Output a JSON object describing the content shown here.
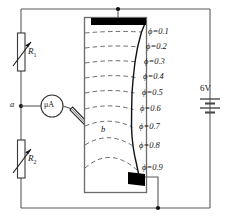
{
  "figure": {
    "colors": {
      "wire": "#5a5a5a",
      "tank": "#6b6b6b",
      "electrode": "#000000",
      "equipotential": "#6b6b6b",
      "fieldline": "#111111",
      "text": "#141414"
    }
  },
  "equipotentials": {
    "symbol": "ϕ",
    "labels": [
      {
        "name": "phi-0-1",
        "symbol": "ϕ",
        "eq": "=",
        "value": "0.1",
        "text": "ϕ=0.1"
      },
      {
        "name": "phi-0-2",
        "symbol": "ϕ",
        "eq": "=",
        "value": "0.2",
        "text": "ϕ=0.2"
      },
      {
        "name": "phi-0-3",
        "symbol": "ϕ",
        "eq": "=",
        "value": "0.3",
        "text": "ϕ=0.3"
      },
      {
        "name": "phi-0-4",
        "symbol": "ϕ",
        "eq": "=",
        "value": "0.4",
        "text": "ϕ=0.4"
      },
      {
        "name": "phi-0-5",
        "symbol": "ϕ",
        "eq": "=",
        "value": "0.5",
        "text": "ϕ=0.5"
      },
      {
        "name": "phi-0-6",
        "symbol": "ϕ",
        "eq": "=",
        "value": "0.6",
        "text": "ϕ=0.6"
      },
      {
        "name": "phi-0-7",
        "symbol": "ϕ",
        "eq": "=",
        "value": "0.7",
        "text": "ϕ=0.7"
      },
      {
        "name": "phi-0-8",
        "symbol": "ϕ",
        "eq": "=",
        "value": "0.8",
        "text": "ϕ=0.8"
      },
      {
        "name": "phi-0-9",
        "symbol": "ϕ",
        "eq": "=",
        "value": "0.9",
        "text": "ϕ=0.9"
      }
    ]
  },
  "components": {
    "resistor_top": {
      "label": "R",
      "subscript": "1",
      "type": "variable-resistor"
    },
    "resistor_bottom": {
      "label": "R",
      "subscript": "2",
      "type": "variable-resistor"
    },
    "meter": {
      "label": "μA",
      "type": "microammeter"
    },
    "battery": {
      "label": "6V",
      "type": "battery"
    },
    "node_a": {
      "label": "a"
    },
    "probe_b": {
      "label": "b"
    },
    "electrode_top": {
      "label": ""
    },
    "electrode_bottom": {
      "label": ""
    }
  }
}
